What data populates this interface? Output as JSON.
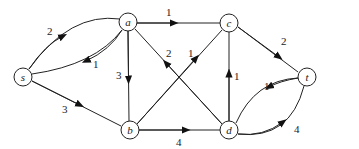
{
  "diagram": {
    "type": "directed-flow-network",
    "nodes": [
      {
        "id": "s",
        "label": "s",
        "x": 23,
        "y": 77
      },
      {
        "id": "a",
        "label": "a",
        "x": 128,
        "y": 22
      },
      {
        "id": "c",
        "label": "c",
        "x": 229,
        "y": 23
      },
      {
        "id": "t",
        "label": "t",
        "x": 307,
        "y": 77
      },
      {
        "id": "b",
        "label": "b",
        "x": 130,
        "y": 130
      },
      {
        "id": "d",
        "label": "d",
        "x": 229,
        "y": 130
      }
    ],
    "edges": [
      {
        "from": "s",
        "to": "a",
        "label": "2"
      },
      {
        "from": "a",
        "to": "s",
        "label": "1"
      },
      {
        "from": "s",
        "to": "b",
        "label": "3"
      },
      {
        "from": "a",
        "to": "c",
        "label": "1"
      },
      {
        "from": "a",
        "to": "b",
        "label": "3"
      },
      {
        "from": "d",
        "to": "a",
        "label": "2"
      },
      {
        "from": "b",
        "to": "c",
        "label": "1"
      },
      {
        "from": "d",
        "to": "c",
        "label": "1"
      },
      {
        "from": "c",
        "to": "t",
        "label": "2"
      },
      {
        "from": "t",
        "to": "d",
        "label": "1"
      },
      {
        "from": "d",
        "to": "t",
        "label": "4"
      },
      {
        "from": "b",
        "to": "d",
        "label": "4"
      }
    ]
  }
}
